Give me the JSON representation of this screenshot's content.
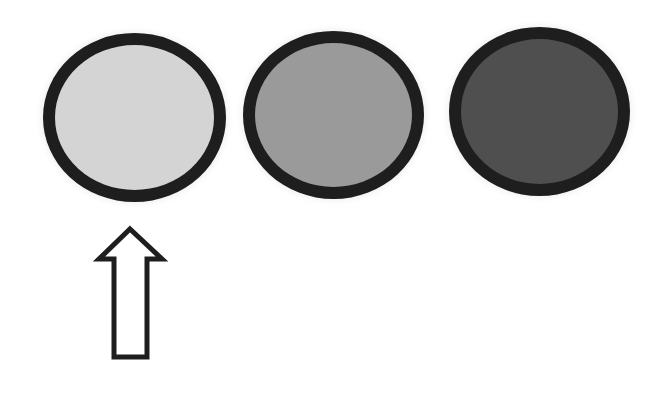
{
  "diagram": {
    "circles": [
      {
        "id": "light",
        "fill": "#d4d4d4",
        "border": "#1e1e1e",
        "x": 43,
        "y": 33,
        "w": 183,
        "h": 169,
        "selected": true
      },
      {
        "id": "medium",
        "fill": "#9a9a9a",
        "border": "#1e1e1e",
        "x": 243,
        "y": 31,
        "w": 181,
        "h": 168,
        "selected": false
      },
      {
        "id": "dark",
        "fill": "#4f4f4f",
        "border": "#1e1e1e",
        "x": 449,
        "y": 27,
        "w": 181,
        "h": 169,
        "selected": false
      }
    ],
    "pointer": {
      "icon": "up-arrow-icon",
      "points_to": "light",
      "fill": "#ffffff",
      "stroke": "#1e1e1e"
    }
  }
}
